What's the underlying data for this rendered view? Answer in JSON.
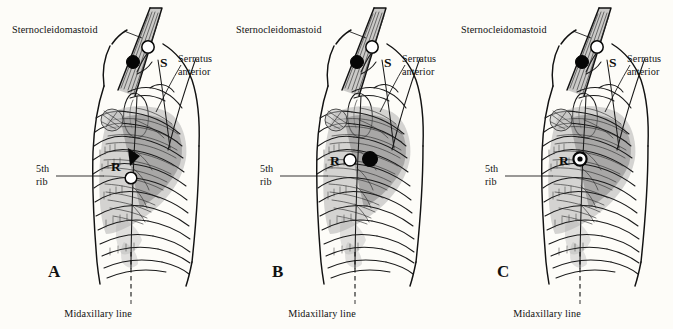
{
  "figure": {
    "background_color": "#fdfcf8",
    "ink_color": "#111111",
    "panel_count": 3
  },
  "labels": {
    "sternocleidomastoid": "Sternocleidomastoid",
    "serratus_line1": "Serratus",
    "serratus_line2": "anterior",
    "rib_line1": "5th",
    "rib_line2": "rib",
    "midaxillary": "Midaxillary line",
    "marker_s": "S",
    "marker_r": "R"
  },
  "panels": [
    {
      "id": "A",
      "letter": "A",
      "s_markers": {
        "open_circle": true,
        "filled_circle": true,
        "label": "S"
      },
      "r_markers": {
        "open_circle": true,
        "filled_circle": false,
        "target_ring": false,
        "arrowhead": true,
        "label": "R"
      },
      "labels_shown": [
        "Sternocleidomastoid",
        "Serratus anterior",
        "5th rib",
        "Midaxillary line"
      ]
    },
    {
      "id": "B",
      "letter": "B",
      "s_markers": {
        "open_circle": true,
        "filled_circle": true,
        "label": "S"
      },
      "r_markers": {
        "open_circle": true,
        "filled_circle": true,
        "target_ring": false,
        "arrowhead": false,
        "label": "R"
      },
      "labels_shown": [
        "Sternocleidomastoid",
        "Serratus anterior",
        "5th rib",
        "Midaxillary line"
      ]
    },
    {
      "id": "C",
      "letter": "C",
      "s_markers": {
        "open_circle": true,
        "filled_circle": true,
        "label": "S"
      },
      "r_markers": {
        "open_circle": false,
        "filled_circle": false,
        "target_ring": true,
        "arrowhead": false,
        "label": "R"
      },
      "labels_shown": [
        "Sternocleidomastoid",
        "Serratus anterior",
        "5th rib",
        "Midaxillary line"
      ]
    }
  ]
}
